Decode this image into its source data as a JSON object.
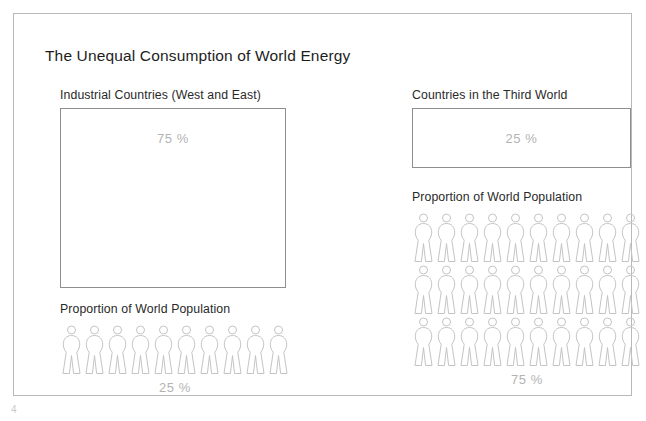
{
  "page": {
    "title": "The Unequal Consumption of World Energy",
    "page_number": "4",
    "frame_color": "#b9b9b9",
    "box_border_color": "#8e8e8e",
    "value_text_color": "#b3b3b3",
    "figure_outline_color": "#c4c4c4"
  },
  "panels": [
    {
      "id": "industrial",
      "heading": "Industrial Countries (West and East)",
      "energy_share": "75 %",
      "population_heading": "Proportion of World Population",
      "population_share": "25 %",
      "figure_rows": [
        10
      ],
      "figure_count": 10
    },
    {
      "id": "third-world",
      "heading": "Countries in the Third World",
      "energy_share": "25 %",
      "population_heading": "Proportion of World Population",
      "population_share": "75 %",
      "figure_rows": [
        10,
        10,
        10
      ],
      "figure_count": 30
    }
  ],
  "chart_data": {
    "type": "pictogram",
    "title": "The Unequal Consumption of World Energy",
    "categories": [
      "Industrial Countries (West and East)",
      "Countries in the Third World"
    ],
    "series": [
      {
        "name": "Share of World Energy Consumption",
        "encoding": "area-box",
        "values": [
          75,
          25
        ],
        "labels": [
          "75 %",
          "25 %"
        ],
        "unit": "%"
      },
      {
        "name": "Proportion of World Population",
        "encoding": "pictogram-figures",
        "values": [
          25,
          75
        ],
        "labels": [
          "25 %",
          "75 %"
        ],
        "unit": "%",
        "figures": [
          10,
          30
        ],
        "figures_per_row": 10,
        "value_per_figure": 2.5
      }
    ],
    "legend": "none",
    "grid": false,
    "icon": "human-figure"
  }
}
